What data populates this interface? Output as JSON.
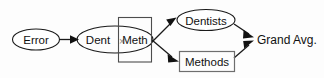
{
  "diagram": {
    "background_color": "#fdfdfd",
    "stroke_color": "#1a1a1a",
    "nodes": [
      {
        "id": "error",
        "label": "Error",
        "shape": "ellipse",
        "x": 36,
        "y": 39
      },
      {
        "id": "interaction_left",
        "label": "Dent",
        "shape": "ellipse-part",
        "x": 99,
        "y": 39
      },
      {
        "id": "interaction_op",
        "label": "×",
        "shape": "operator",
        "x": 122,
        "y": 40
      },
      {
        "id": "interaction_right",
        "label": "Meth",
        "shape": "rect",
        "x": 135,
        "y": 39
      },
      {
        "id": "dentists",
        "label": "Dentists",
        "shape": "ellipse",
        "x": 206,
        "y": 20
      },
      {
        "id": "methods",
        "label": "Methods",
        "shape": "rect",
        "x": 207,
        "y": 62
      },
      {
        "id": "grand_avg",
        "label": "Grand Avg.",
        "shape": "text",
        "x": 258,
        "y": 39
      }
    ],
    "edges": [
      {
        "id": "error-to-interaction",
        "from": "error",
        "to": "interaction",
        "arrow": true
      },
      {
        "id": "interaction-to-dentists",
        "from": "interaction",
        "to": "dentists",
        "arrow": true
      },
      {
        "id": "interaction-to-methods",
        "from": "interaction",
        "to": "methods",
        "arrow": true
      },
      {
        "id": "dentists-to-grand-avg",
        "from": "dentists",
        "to": "grand_avg",
        "arrow": true
      },
      {
        "id": "methods-to-grand-avg",
        "from": "methods",
        "to": "grand_avg",
        "arrow": true
      }
    ]
  }
}
